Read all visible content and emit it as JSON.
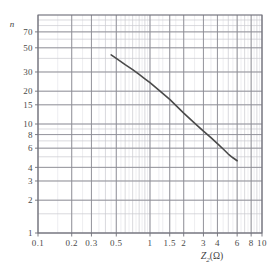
{
  "chart_data": {
    "type": "line",
    "title": "",
    "subtitle": "",
    "xlabel": "Z₂(Ω)",
    "xlabel_symbol": "Z",
    "xlabel_subscript": "2",
    "xlabel_unit": "(Ω)",
    "ylabel": "n",
    "xscale": "log",
    "yscale": "log",
    "xlim": [
      0.1,
      10
    ],
    "ylim": [
      1,
      100
    ],
    "grid": true,
    "legend": false,
    "legend_position": "none",
    "xticks": [
      {
        "value": 0.1,
        "label": "0.1"
      },
      {
        "value": 0.2,
        "label": "0.2"
      },
      {
        "value": 0.3,
        "label": "0.3"
      },
      {
        "value": 0.5,
        "label": "0.5"
      },
      {
        "value": 1,
        "label": "1"
      },
      {
        "value": 1.5,
        "label": "1.5"
      },
      {
        "value": 2,
        "label": "2"
      },
      {
        "value": 3,
        "label": "3"
      },
      {
        "value": 4,
        "label": "4"
      },
      {
        "value": 6,
        "label": "6"
      },
      {
        "value": 8,
        "label": "8"
      },
      {
        "value": 10,
        "label": "10"
      }
    ],
    "yticks": [
      {
        "value": 70,
        "label": "70"
      },
      {
        "value": 50,
        "label": "50"
      },
      {
        "value": 30,
        "label": "30"
      },
      {
        "value": 20,
        "label": "20"
      },
      {
        "value": 15,
        "label": "15"
      },
      {
        "value": 10,
        "label": "10"
      },
      {
        "value": 8,
        "label": "8"
      },
      {
        "value": 6,
        "label": "6"
      },
      {
        "value": 4,
        "label": "4"
      },
      {
        "value": 3,
        "label": "3"
      },
      {
        "value": 2,
        "label": "2"
      },
      {
        "value": 1,
        "label": "1"
      }
    ],
    "x_minor_gridlines": [
      0.1,
      0.2,
      0.3,
      0.4,
      0.5,
      0.6,
      0.7,
      0.8,
      0.9,
      1,
      1.5,
      2,
      3,
      4,
      5,
      6,
      7,
      8,
      9,
      10
    ],
    "y_minor_gridlines": [
      1,
      1.5,
      2,
      3,
      4,
      5,
      6,
      7,
      8,
      9,
      10,
      15,
      20,
      30,
      40,
      50,
      60,
      70,
      80,
      90,
      100
    ],
    "series": [
      {
        "name": "n vs Z2",
        "color": "#4a4a4a",
        "linewidth": 1.6,
        "x": [
          0.45,
          0.5,
          0.6,
          0.7,
          0.8,
          0.9,
          1.0,
          1.2,
          1.5,
          2.0,
          2.5,
          3.0,
          3.5,
          4.0,
          4.5,
          5.0,
          5.5,
          6.0
        ],
        "y": [
          43.0,
          40.0,
          35.0,
          31.5,
          28.5,
          26.0,
          24.0,
          20.5,
          16.8,
          12.6,
          10.2,
          8.6,
          7.5,
          6.6,
          5.9,
          5.3,
          4.9,
          4.6
        ]
      }
    ],
    "colors": {
      "grid_major": "#8a8a92",
      "grid_minor": "#c9c9cf",
      "frame": "#6f6f78",
      "curve": "#4a4a4a",
      "text": "#3f3f3f",
      "background": "#ffffff"
    }
  },
  "figure": {
    "plot_left_px": 38,
    "plot_right_px": 262,
    "plot_top_px": 15,
    "plot_bottom_px": 233
  }
}
